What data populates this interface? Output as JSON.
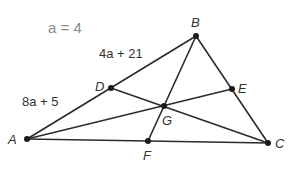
{
  "given": {
    "text": "a = 4",
    "x": 48,
    "y": 33
  },
  "points": [
    {
      "name": "A",
      "x": 27,
      "y": 139,
      "lx": 8,
      "ly": 144
    },
    {
      "name": "B",
      "x": 196,
      "y": 36,
      "lx": 191,
      "ly": 27
    },
    {
      "name": "C",
      "x": 268,
      "y": 143,
      "lx": 275,
      "ly": 148
    },
    {
      "name": "D",
      "x": 111,
      "y": 88,
      "lx": 95,
      "ly": 91
    },
    {
      "name": "E",
      "x": 232,
      "y": 89,
      "lx": 238,
      "ly": 93
    },
    {
      "name": "F",
      "x": 148,
      "y": 141,
      "lx": 143,
      "ly": 160
    },
    {
      "name": "G",
      "x": 164,
      "y": 106,
      "lx": 162,
      "ly": 125
    }
  ],
  "segments": [
    [
      "A",
      "B"
    ],
    [
      "B",
      "C"
    ],
    [
      "A",
      "C"
    ],
    [
      "A",
      "E"
    ],
    [
      "C",
      "D"
    ],
    [
      "B",
      "F"
    ]
  ],
  "labels": [
    {
      "id": "bd-length",
      "text": "4a + 21",
      "x": 99,
      "y": 58
    },
    {
      "id": "ad-length",
      "text": "8a + 5",
      "x": 22,
      "y": 106
    }
  ]
}
